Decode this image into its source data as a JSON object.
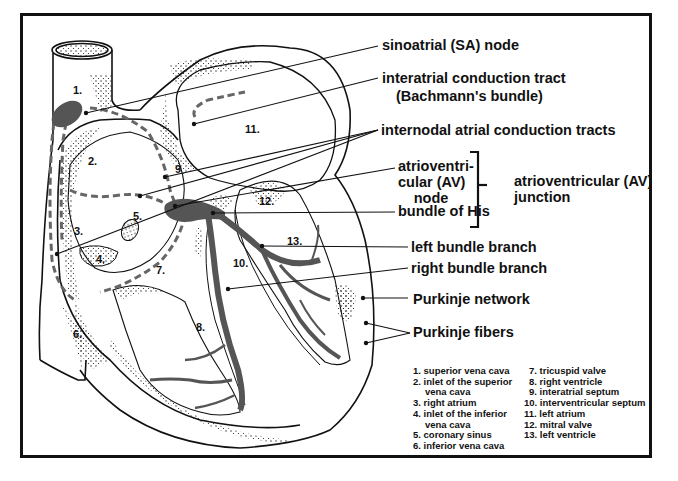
{
  "colors": {
    "ink": "#111111",
    "conduction_fill": "#555555",
    "dashed_tract": "#666666",
    "background": "#ffffff"
  },
  "callouts": {
    "sa_node": "sinoatrial (SA) node",
    "interatrial_tract_line1": "interatrial conduction tract",
    "interatrial_tract_line2": "(Bachmann's bundle)",
    "internodal_tracts": "internodal atrial conduction tracts",
    "av_node_line1": "atrioventri-",
    "av_node_line2": "cular (AV)",
    "av_node_line3": "node",
    "bundle_of_his": "bundle of His",
    "av_junction_line1": "atrioventricular (AV)",
    "av_junction_line2": "junction",
    "left_bundle_branch": "left bundle branch",
    "right_bundle_branch": "right bundle branch",
    "purkinje_network": "Purkinje network",
    "purkinje_fibers": "Purkinje fibers"
  },
  "region_numbers": [
    "1.",
    "2.",
    "3.",
    "4.",
    "5.",
    "6.",
    "7.",
    "8.",
    "9",
    "10.",
    "11.",
    "12.",
    "13."
  ],
  "legend": {
    "column1": [
      {
        "line1": "1. superior vena cava",
        "line2": ""
      },
      {
        "line1": "2. inlet of the superior",
        "line2": "vena cava"
      },
      {
        "line1": "3. right atrium",
        "line2": ""
      },
      {
        "line1": "4. inlet of the inferior",
        "line2": "vena cava"
      },
      {
        "line1": "5. coronary sinus",
        "line2": ""
      },
      {
        "line1": "6. inferior vena cava",
        "line2": ""
      }
    ],
    "column2": [
      {
        "line1": "7. tricuspid valve"
      },
      {
        "line1": "8. right ventricle"
      },
      {
        "line1": "9. interatrial septum"
      },
      {
        "line1": "10. interventricular septum"
      },
      {
        "line1": "11. left atrium"
      },
      {
        "line1": "12. mitral valve"
      },
      {
        "line1": "13. left ventricle"
      }
    ]
  }
}
